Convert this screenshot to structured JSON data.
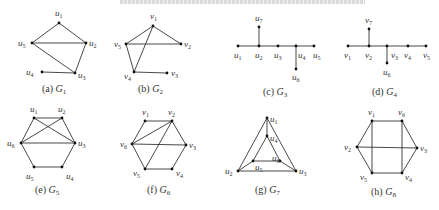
{
  "header": {
    "clipped_text_line": ""
  },
  "figures": [
    {
      "id": "a",
      "caption_prefix": "(a) ",
      "caption_graph": "G",
      "caption_sub": "1",
      "nodes": [
        {
          "name": "u",
          "sub": "1",
          "x": 59,
          "y": 23,
          "lx": 55,
          "ly": 16
        },
        {
          "name": "u",
          "sub": "5",
          "x": 32,
          "y": 43,
          "lx": 18,
          "ly": 46
        },
        {
          "name": "u",
          "sub": "2",
          "x": 86,
          "y": 43,
          "lx": 89,
          "ly": 46
        },
        {
          "name": "u",
          "sub": "4",
          "x": 42,
          "y": 72,
          "lx": 26,
          "ly": 75
        },
        {
          "name": "u",
          "sub": "3",
          "x": 75,
          "y": 73,
          "lx": 78,
          "ly": 78
        }
      ],
      "edges": [
        [
          0,
          1
        ],
        [
          0,
          2
        ],
        [
          1,
          2
        ],
        [
          1,
          4
        ],
        [
          2,
          4
        ],
        [
          3,
          4
        ]
      ],
      "caption_x": 42,
      "caption_y": 92
    },
    {
      "id": "b",
      "caption_prefix": "(b) ",
      "caption_graph": "G",
      "caption_sub": "2",
      "nodes": [
        {
          "name": "v",
          "sub": "1",
          "x": 153,
          "y": 26,
          "lx": 150,
          "ly": 19
        },
        {
          "name": "v",
          "sub": "5",
          "x": 126,
          "y": 44,
          "lx": 114,
          "ly": 47
        },
        {
          "name": "v",
          "sub": "2",
          "x": 181,
          "y": 44,
          "lx": 184,
          "ly": 47
        },
        {
          "name": "v",
          "sub": "4",
          "x": 134,
          "y": 72,
          "lx": 124,
          "ly": 79
        },
        {
          "name": "v",
          "sub": "3",
          "x": 167,
          "y": 73,
          "lx": 171,
          "ly": 76
        }
      ],
      "edges": [
        [
          0,
          1
        ],
        [
          0,
          2
        ],
        [
          1,
          2
        ],
        [
          0,
          3
        ],
        [
          1,
          3
        ],
        [
          3,
          4
        ]
      ],
      "caption_x": 138,
      "caption_y": 92
    },
    {
      "id": "c",
      "caption_prefix": "(c) ",
      "caption_graph": "G",
      "caption_sub": "3",
      "nodes": [
        {
          "name": "u",
          "sub": "1",
          "x": 238,
          "y": 46,
          "lx": 234,
          "ly": 58
        },
        {
          "name": "u",
          "sub": "2",
          "x": 259,
          "y": 46,
          "lx": 255,
          "ly": 58
        },
        {
          "name": "u",
          "sub": "3",
          "x": 278,
          "y": 46,
          "lx": 274,
          "ly": 58
        },
        {
          "name": "u",
          "sub": "4",
          "x": 296,
          "y": 46,
          "lx": 298,
          "ly": 58
        },
        {
          "name": "u",
          "sub": "5",
          "x": 314,
          "y": 46,
          "lx": 313,
          "ly": 58
        },
        {
          "name": "u",
          "sub": "7",
          "x": 259,
          "y": 27,
          "lx": 255,
          "ly": 21
        },
        {
          "name": "u",
          "sub": "6",
          "x": 296,
          "y": 69,
          "lx": 292,
          "ly": 80
        }
      ],
      "edges": [
        [
          0,
          1
        ],
        [
          1,
          2
        ],
        [
          2,
          3
        ],
        [
          3,
          4
        ],
        [
          1,
          5
        ],
        [
          3,
          6
        ]
      ],
      "caption_x": 263,
      "caption_y": 95
    },
    {
      "id": "d",
      "caption_prefix": "(d) ",
      "caption_graph": "G",
      "caption_sub": "4",
      "nodes": [
        {
          "name": "v",
          "sub": "1",
          "x": 348,
          "y": 46,
          "lx": 344,
          "ly": 58
        },
        {
          "name": "v",
          "sub": "2",
          "x": 369,
          "y": 46,
          "lx": 365,
          "ly": 58
        },
        {
          "name": "v",
          "sub": "3",
          "x": 387,
          "y": 46,
          "lx": 391,
          "ly": 58
        },
        {
          "name": "v",
          "sub": "4",
          "x": 408,
          "y": 46,
          "lx": 404,
          "ly": 58
        },
        {
          "name": "v",
          "sub": "5",
          "x": 426,
          "y": 46,
          "lx": 423,
          "ly": 58
        },
        {
          "name": "v",
          "sub": "7",
          "x": 369,
          "y": 29,
          "lx": 365,
          "ly": 23
        },
        {
          "name": "u",
          "sub": "6",
          "x": 387,
          "y": 63,
          "lx": 383,
          "ly": 75
        }
      ],
      "edges": [
        [
          0,
          1
        ],
        [
          1,
          2
        ],
        [
          2,
          3
        ],
        [
          3,
          4
        ],
        [
          1,
          5
        ],
        [
          2,
          6
        ]
      ],
      "caption_x": 372,
      "caption_y": 95
    },
    {
      "id": "e",
      "caption_prefix": "(e) ",
      "caption_graph": "G",
      "caption_sub": "5",
      "nodes": [
        {
          "name": "u",
          "sub": "1",
          "x": 34,
          "y": 118,
          "lx": 30,
          "ly": 112
        },
        {
          "name": "u",
          "sub": "2",
          "x": 62,
          "y": 118,
          "lx": 58,
          "ly": 112
        },
        {
          "name": "u",
          "sub": "6",
          "x": 21,
          "y": 143,
          "lx": 7,
          "ly": 146
        },
        {
          "name": "u",
          "sub": "3",
          "x": 75,
          "y": 143,
          "lx": 78,
          "ly": 146
        },
        {
          "name": "u",
          "sub": "5",
          "x": 34,
          "y": 167,
          "lx": 26,
          "ly": 179
        },
        {
          "name": "u",
          "sub": "4",
          "x": 62,
          "y": 167,
          "lx": 66,
          "ly": 179
        }
      ],
      "edges": [
        [
          0,
          1
        ],
        [
          0,
          2
        ],
        [
          1,
          3
        ],
        [
          2,
          4
        ],
        [
          3,
          5
        ],
        [
          4,
          5
        ],
        [
          2,
          3
        ],
        [
          0,
          3
        ],
        [
          1,
          2
        ]
      ],
      "caption_x": 35,
      "caption_y": 193
    },
    {
      "id": "f",
      "caption_prefix": "(f) ",
      "caption_graph": "G",
      "caption_sub": "6",
      "nodes": [
        {
          "name": "v",
          "sub": "1",
          "x": 145,
          "y": 121,
          "lx": 142,
          "ly": 115
        },
        {
          "name": "v",
          "sub": "2",
          "x": 172,
          "y": 121,
          "lx": 168,
          "ly": 115
        },
        {
          "name": "v",
          "sub": "6",
          "x": 132,
          "y": 144,
          "lx": 120,
          "ly": 147
        },
        {
          "name": "v",
          "sub": "3",
          "x": 186,
          "y": 145,
          "lx": 189,
          "ly": 148
        },
        {
          "name": "v",
          "sub": "5",
          "x": 145,
          "y": 169,
          "lx": 133,
          "ly": 176
        },
        {
          "name": "v",
          "sub": "4",
          "x": 172,
          "y": 169,
          "lx": 176,
          "ly": 176
        }
      ],
      "edges": [
        [
          0,
          1
        ],
        [
          0,
          2
        ],
        [
          1,
          3
        ],
        [
          2,
          4
        ],
        [
          3,
          5
        ],
        [
          4,
          5
        ],
        [
          2,
          3
        ],
        [
          1,
          2
        ],
        [
          1,
          4
        ]
      ],
      "caption_x": 147,
      "caption_y": 193
    },
    {
      "id": "g",
      "caption_prefix": "(g) ",
      "caption_graph": "G",
      "caption_sub": "7",
      "nodes": [
        {
          "name": "u",
          "sub": "1",
          "x": 267,
          "y": 118,
          "lx": 270,
          "ly": 122
        },
        {
          "name": "u",
          "sub": "4",
          "x": 267,
          "y": 136,
          "lx": 270,
          "ly": 141
        },
        {
          "name": "u",
          "sub": "2",
          "x": 238,
          "y": 171,
          "lx": 225,
          "ly": 174
        },
        {
          "name": "u",
          "sub": "3",
          "x": 296,
          "y": 171,
          "lx": 299,
          "ly": 174
        },
        {
          "name": "u",
          "sub": "5",
          "x": 253,
          "y": 161,
          "lx": 255,
          "ly": 170
        },
        {
          "name": "u",
          "sub": "6",
          "x": 280,
          "y": 161,
          "lx": 272,
          "ly": 161
        }
      ],
      "edges": [
        [
          0,
          2
        ],
        [
          0,
          3
        ],
        [
          2,
          3
        ],
        [
          0,
          1
        ],
        [
          1,
          4
        ],
        [
          1,
          5
        ],
        [
          4,
          5
        ],
        [
          2,
          4
        ],
        [
          3,
          5
        ]
      ],
      "caption_x": 255,
      "caption_y": 193
    },
    {
      "id": "h",
      "caption_prefix": "(h) ",
      "caption_graph": "G",
      "caption_sub": "8",
      "nodes": [
        {
          "name": "v",
          "sub": "1",
          "x": 372,
          "y": 121,
          "lx": 368,
          "ly": 115
        },
        {
          "name": "v",
          "sub": "6",
          "x": 402,
          "y": 121,
          "lx": 398,
          "ly": 115
        },
        {
          "name": "v",
          "sub": "2",
          "x": 357,
          "y": 147,
          "lx": 344,
          "ly": 150
        },
        {
          "name": "v",
          "sub": "3",
          "x": 417,
          "y": 148,
          "lx": 420,
          "ly": 151
        },
        {
          "name": "v",
          "sub": "5",
          "x": 372,
          "y": 173,
          "lx": 360,
          "ly": 180
        },
        {
          "name": "v",
          "sub": "4",
          "x": 402,
          "y": 173,
          "lx": 405,
          "ly": 180
        }
      ],
      "edges": [
        [
          0,
          1
        ],
        [
          0,
          2
        ],
        [
          1,
          3
        ],
        [
          2,
          4
        ],
        [
          3,
          5
        ],
        [
          4,
          5
        ],
        [
          2,
          3
        ],
        [
          0,
          4
        ],
        [
          1,
          5
        ]
      ],
      "caption_x": 371,
      "caption_y": 195
    }
  ]
}
